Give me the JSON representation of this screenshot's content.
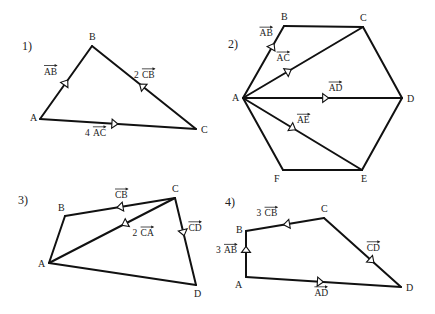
{
  "figures": [
    {
      "number": "1)",
      "shape": "triangle",
      "vertices": [
        "A",
        "B",
        "C"
      ],
      "edges": [
        [
          "A",
          "B"
        ],
        [
          "B",
          "C"
        ],
        [
          "A",
          "C"
        ]
      ],
      "vectors": [
        {
          "coef": "",
          "name": "AB",
          "from": "A",
          "to": "B"
        },
        {
          "coef": "2",
          "name": "CB",
          "from": "C",
          "to": "B"
        },
        {
          "coef": "4",
          "name": "AC",
          "from": "A",
          "to": "C"
        }
      ]
    },
    {
      "number": "2)",
      "shape": "hexagon",
      "vertices": [
        "A",
        "B",
        "C",
        "D",
        "E",
        "F"
      ],
      "edges": [
        [
          "A",
          "B"
        ],
        [
          "B",
          "C"
        ],
        [
          "C",
          "D"
        ],
        [
          "D",
          "E"
        ],
        [
          "E",
          "F"
        ],
        [
          "F",
          "A"
        ],
        [
          "A",
          "C"
        ],
        [
          "A",
          "D"
        ],
        [
          "A",
          "E"
        ]
      ],
      "vectors": [
        {
          "coef": "",
          "name": "AB",
          "from": "A",
          "to": "B"
        },
        {
          "coef": "",
          "name": "AC",
          "from": "A",
          "to": "C"
        },
        {
          "coef": "",
          "name": "AD",
          "from": "A",
          "to": "D"
        },
        {
          "coef": "",
          "name": "AE",
          "from": "A",
          "to": "E"
        }
      ]
    },
    {
      "number": "3)",
      "shape": "quadrilateral",
      "vertices": [
        "A",
        "B",
        "C",
        "D"
      ],
      "edges": [
        [
          "A",
          "B"
        ],
        [
          "B",
          "C"
        ],
        [
          "C",
          "D"
        ],
        [
          "D",
          "A"
        ],
        [
          "A",
          "C"
        ]
      ],
      "vectors": [
        {
          "coef": "",
          "name": "CB",
          "from": "C",
          "to": "B"
        },
        {
          "coef": "2",
          "name": "CA",
          "from": "C",
          "to": "A"
        },
        {
          "coef": "",
          "name": "CD",
          "from": "C",
          "to": "D"
        }
      ]
    },
    {
      "number": "4)",
      "shape": "quadrilateral",
      "vertices": [
        "A",
        "B",
        "C",
        "D"
      ],
      "edges": [
        [
          "A",
          "B"
        ],
        [
          "B",
          "C"
        ],
        [
          "C",
          "D"
        ],
        [
          "D",
          "A"
        ]
      ],
      "vectors": [
        {
          "coef": "3",
          "name": "AB",
          "from": "A",
          "to": "B"
        },
        {
          "coef": "3",
          "name": "CB",
          "from": "C",
          "to": "B"
        },
        {
          "coef": "",
          "name": "CD",
          "from": "C",
          "to": "D"
        },
        {
          "coef": "",
          "name": "AD",
          "from": "A",
          "to": "D"
        }
      ]
    }
  ]
}
